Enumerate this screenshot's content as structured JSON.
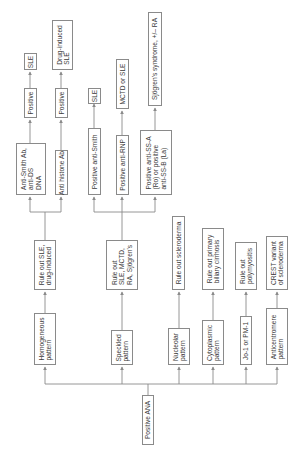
{
  "diagram": {
    "orientation": "rotated-90-ccw",
    "colors": {
      "line": "#8a8a8a",
      "text": "#3a3a3a",
      "background": "#ffffff"
    },
    "root": {
      "label": "Positive ANA"
    },
    "patterns": [
      {
        "label": "Homogeneous\npattern"
      },
      {
        "label": "Speckled\npattern"
      },
      {
        "label": "Nucleolar\npattern"
      },
      {
        "label": "Cytoplasmic\npattern"
      },
      {
        "label": "Jo-1 or PM-1"
      },
      {
        "label": "Anticentromere\npattern"
      }
    ],
    "ruleouts": [
      {
        "label": "Rule out SLE,\ndrug-induced"
      },
      {
        "label": "Rule out\nSLE, MCTD,\nRA, Sjögren's"
      },
      {
        "label": "Rule out scleroderma"
      },
      {
        "label": "Rule out primary\nbiliary cirrhosis"
      },
      {
        "label": "Rule out\npolymyositis"
      },
      {
        "label": "CREST variant\nof scleroderma"
      }
    ],
    "tests": [
      {
        "label": "Anti-Smith Ab,\nanti-DS\nDNA"
      },
      {
        "label": "Anti histone Ab"
      },
      {
        "label": "Positive anti-Smith"
      },
      {
        "label": "Positive anti-RNP"
      },
      {
        "label": "Positive anti-SS-A\n(Ro) or positive\nanti-SS-B (La)"
      }
    ],
    "positives": [
      {
        "label": "Positive"
      },
      {
        "label": "Positive"
      }
    ],
    "results": [
      {
        "label": "SLE"
      },
      {
        "label": "Drug-induced\nSLE"
      },
      {
        "label": "SLE"
      },
      {
        "label": "MCTD or SLE"
      },
      {
        "label": "Sjögren's syndrome, +/– RA"
      }
    ]
  }
}
